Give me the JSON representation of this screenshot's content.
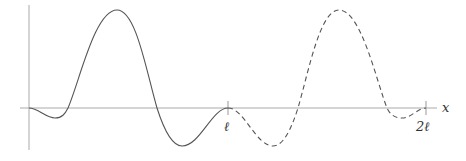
{
  "diagram": {
    "axes": {
      "x_label": "x",
      "ticks": [
        {
          "label": "ℓ",
          "position": "l"
        },
        {
          "label": "2ℓ",
          "position": "2l"
        }
      ]
    },
    "curves": [
      {
        "name": "original",
        "style": "solid",
        "domain": "[0, l]"
      },
      {
        "name": "extension",
        "style": "dashed",
        "domain": "[l, 2l]"
      }
    ],
    "colors": {
      "axis": "#aaaaaa",
      "curve": "#555555"
    }
  }
}
